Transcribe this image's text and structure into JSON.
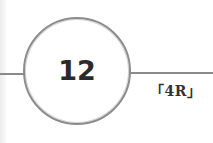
{
  "badge": {
    "number": "12",
    "label": "「4R」"
  },
  "colors": {
    "circle_stroke": "#8c8c8c",
    "line": "#8a8a8a",
    "text": "#2a2a2a",
    "background": "#ffffff"
  }
}
